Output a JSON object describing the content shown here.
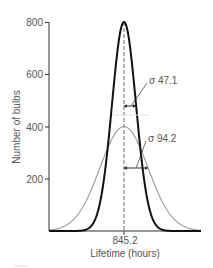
{
  "chart_data": {
    "type": "line",
    "title": "",
    "xlabel": "Lifetime (hours)",
    "ylabel": "Number of bulbs",
    "ylim": [
      0,
      800
    ],
    "yticks": [
      200,
      400,
      600,
      800
    ],
    "xticks": [
      845.2
    ],
    "xtick_labels": [
      "845.2"
    ],
    "grid": false,
    "legend": null,
    "mean": 845.2,
    "series": [
      {
        "name": "narrow distribution",
        "distribution": "normal",
        "mean": 845.2,
        "sigma": 47.1,
        "peak": 800,
        "color": "#111111",
        "stroke_width": 2
      },
      {
        "name": "wide distribution",
        "distribution": "normal",
        "mean": 845.2,
        "sigma": 94.2,
        "peak": 400,
        "color": "#999999",
        "stroke_width": 1
      }
    ],
    "annotations": [
      {
        "text": "σ 47.1",
        "series": "narrow distribution"
      },
      {
        "text": "σ 94.2",
        "series": "wide distribution"
      }
    ],
    "reference_lines": [
      {
        "type": "vertical",
        "x": 845.2,
        "style": "dashed"
      }
    ]
  },
  "labels": {
    "xlabel": "Lifetime (hours)",
    "ylabel": "Number of bulbs",
    "x_center": "845.2",
    "sigma_narrow": "σ 47.1",
    "sigma_wide": "σ 94.2",
    "y200": "200",
    "y400": "400",
    "y600": "600",
    "y800": "800"
  }
}
